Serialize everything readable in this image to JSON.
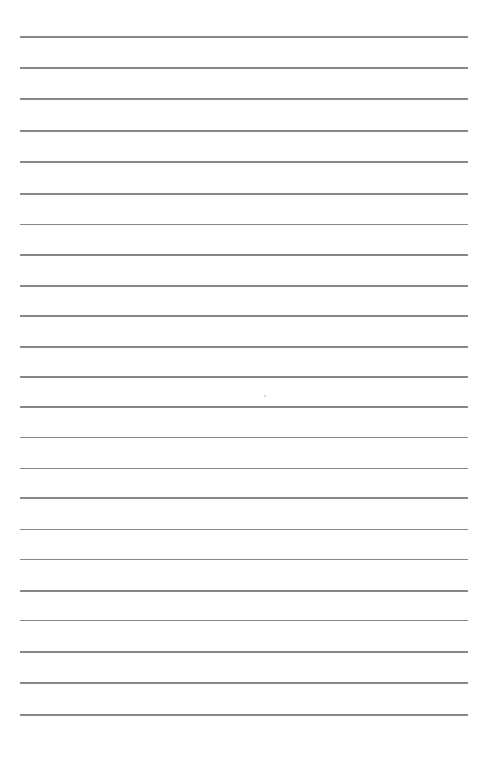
{
  "page": {
    "type": "blank-lined-paper",
    "background_color": "#ffffff",
    "rule_color": "#7a7a7a",
    "rule_left": 20,
    "rule_right": 468,
    "rule_positions": [
      37,
      68,
      99,
      131,
      162,
      194,
      224.5,
      255,
      286,
      316,
      347,
      377,
      407,
      437.5,
      468.5,
      498,
      529.5,
      559.5,
      591,
      620.5,
      652,
      683,
      715
    ],
    "text_content": ""
  }
}
